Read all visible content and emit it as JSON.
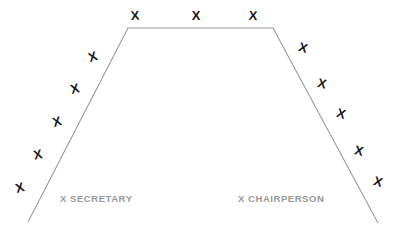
{
  "diagram": {
    "type": "seating-chart",
    "background_color": "#ffffff",
    "table": {
      "name": "conference-table",
      "shape": "trapezoid-open-bottom",
      "stroke_color": "#999999",
      "stroke_width": 1.1,
      "path": "M 28 222 L 128 28 L 273 28 L 378 223",
      "points": [
        {
          "x": 28,
          "y": 222
        },
        {
          "x": 128,
          "y": 28
        },
        {
          "x": 273,
          "y": 28
        },
        {
          "x": 378,
          "y": 223
        }
      ]
    },
    "seat_symbol": "X",
    "seat_color": "#1a1a1a",
    "seats": [
      {
        "id": "top-1",
        "side": "top",
        "symbol": "X",
        "x": 135,
        "y": 16,
        "rotation": -4
      },
      {
        "id": "top-2",
        "side": "top",
        "symbol": "X",
        "x": 196,
        "y": 16,
        "rotation": 0
      },
      {
        "id": "top-3",
        "side": "top",
        "symbol": "X",
        "x": 253,
        "y": 16,
        "rotation": 3
      },
      {
        "id": "left-1",
        "side": "left",
        "symbol": "X",
        "x": 93,
        "y": 57,
        "rotation": -18
      },
      {
        "id": "left-2",
        "side": "left",
        "symbol": "X",
        "x": 75,
        "y": 89,
        "rotation": -14
      },
      {
        "id": "left-3",
        "side": "left",
        "symbol": "X",
        "x": 57,
        "y": 122,
        "rotation": -16
      },
      {
        "id": "left-4",
        "side": "left",
        "symbol": "X",
        "x": 38,
        "y": 155,
        "rotation": -12
      },
      {
        "id": "left-5",
        "side": "left",
        "symbol": "X",
        "x": 20,
        "y": 188,
        "rotation": -15
      },
      {
        "id": "right-1",
        "side": "right",
        "symbol": "X",
        "x": 303,
        "y": 48,
        "rotation": 16
      },
      {
        "id": "right-2",
        "side": "right",
        "symbol": "X",
        "x": 322,
        "y": 84,
        "rotation": 14
      },
      {
        "id": "right-3",
        "side": "right",
        "symbol": "X",
        "x": 341,
        "y": 114,
        "rotation": 17
      },
      {
        "id": "right-4",
        "side": "right",
        "symbol": "X",
        "x": 359,
        "y": 151,
        "rotation": 13
      },
      {
        "id": "right-5",
        "side": "right",
        "symbol": "X",
        "x": 378,
        "y": 182,
        "rotation": 16
      }
    ],
    "labels": [
      {
        "id": "secretary",
        "text": "X SECRETARY",
        "x": 60,
        "y": 193,
        "color": "#999999"
      },
      {
        "id": "chairperson",
        "text": "X CHAIRPERSON",
        "x": 238,
        "y": 193,
        "color": "#999999"
      }
    ]
  }
}
